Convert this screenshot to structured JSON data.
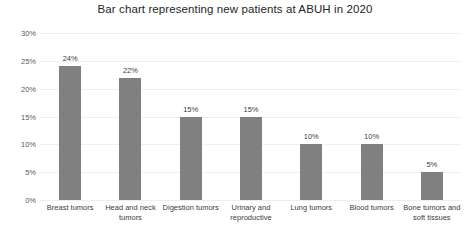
{
  "chart_data": {
    "type": "bar",
    "title": "Bar chart representing new patients at ABUH in 2020",
    "xlabel": "",
    "ylabel": "",
    "ylim": [
      0,
      30
    ],
    "y_tick_step": 5,
    "grid": true,
    "legend": "none",
    "value_suffix": "%",
    "bar_color": "#808080",
    "gridline_color": "#f0f0f0",
    "background_color": "#ffffff",
    "title_color": "#262626",
    "label_color": "#3d3d3d",
    "categories": [
      "Breast tumors",
      "Head and neck tumors",
      "Digestion tumors",
      "Urinary and reproductive",
      "Lung tumors",
      "Blood tumors",
      "Bone tumors and soft tissues"
    ],
    "values": [
      24,
      22,
      15,
      15,
      10,
      10,
      5
    ],
    "value_labels": [
      "24%",
      "22%",
      "15%",
      "15%",
      "10%",
      "10%",
      "5%"
    ],
    "y_tick_labels": [
      "30%",
      "25%",
      "20%",
      "15%",
      "10%",
      "5%",
      "0%"
    ],
    "y_tick_values": [
      30,
      25,
      20,
      15,
      10,
      5,
      0
    ]
  }
}
